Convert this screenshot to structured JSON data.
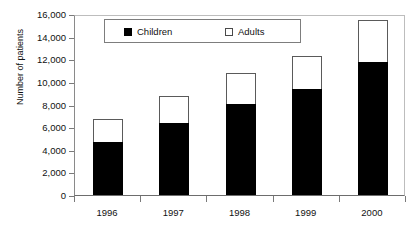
{
  "chart_data": {
    "type": "bar",
    "stacked": true,
    "title": "",
    "subtitle": "",
    "xlabel": "",
    "ylabel": "Number of patients",
    "categories": [
      "1996",
      "1997",
      "1998",
      "1999",
      "2000"
    ],
    "series": [
      {
        "name": "Children",
        "color": "#000000",
        "values": [
          4700,
          6400,
          8050,
          9400,
          11750
        ]
      },
      {
        "name": "Adults",
        "color": "#ffffff",
        "values": [
          2000,
          2350,
          2750,
          2900,
          3750
        ]
      }
    ],
    "totals": [
      6700,
      8750,
      10800,
      12300,
      15500
    ],
    "ylim": [
      0,
      16000
    ],
    "ytick_step": 2000,
    "ytick_labels": [
      "0",
      "2,000",
      "4,000",
      "6,000",
      "8,000",
      "10,000",
      "12,000",
      "14,000",
      "16,000"
    ],
    "ytick_values": [
      0,
      2000,
      4000,
      6000,
      8000,
      10000,
      12000,
      14000,
      16000
    ],
    "grid": false,
    "legend_position": "top-center",
    "legend_entries": [
      {
        "label": "Children",
        "swatch": "filled-black-square"
      },
      {
        "label": "Adults",
        "swatch": "open-white-square"
      }
    ]
  }
}
